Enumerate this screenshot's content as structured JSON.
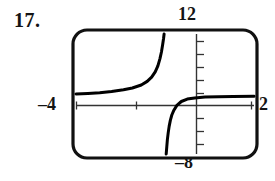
{
  "figure": {
    "exercise_number": "17.",
    "kind": "graphing-calculator-viewing-window",
    "labels": {
      "ymax": "12",
      "ymin": "–8",
      "xmin": "–4",
      "xmax": "2"
    },
    "colors": {
      "ink": "#141414",
      "curve": "#000000",
      "axis": "#333333",
      "frame": "#111111",
      "background": "#ffffff"
    }
  },
  "chart_data": {
    "type": "line",
    "title": "",
    "xlabel": "",
    "ylabel": "",
    "xlim": [
      -4,
      2
    ],
    "ylim": [
      -8,
      12
    ],
    "grid": false,
    "legend": false,
    "tick_labels": {
      "x": [
        "-4",
        "2"
      ],
      "y": [
        "-8",
        "12"
      ]
    },
    "x_tick_interval": 1,
    "y_tick_interval": 2,
    "asymptotes": {
      "vertical": [
        -1
      ],
      "horizontal": [
        1.5
      ]
    },
    "series": [
      {
        "name": "left-branch",
        "comment": "branch left of the vertical asymptote, rises from the horizontal asymptote to the top of the window",
        "x": [
          -4.0,
          -3.6,
          -3.2,
          -2.8,
          -2.4,
          -2.1,
          -1.8,
          -1.6,
          -1.45,
          -1.33,
          -1.24,
          -1.17,
          -1.12,
          -1.08,
          -1.05,
          -1.03
        ],
        "y": [
          2.0,
          2.1,
          2.2,
          2.4,
          2.7,
          3.0,
          3.5,
          4.1,
          4.8,
          5.7,
          6.7,
          7.9,
          9.0,
          10.2,
          11.2,
          12.0
        ]
      },
      {
        "name": "right-branch",
        "comment": "branch right of the vertical asymptote, rises from the bottom of the window and flattens toward the horizontal asymptote",
        "x": [
          -0.96,
          -0.94,
          -0.92,
          -0.89,
          -0.86,
          -0.82,
          -0.77,
          -0.7,
          -0.6,
          -0.45,
          -0.25,
          0.0,
          0.35,
          0.8,
          1.3,
          2.0
        ],
        "y": [
          -8.0,
          -6.8,
          -5.6,
          -4.4,
          -3.4,
          -2.4,
          -1.5,
          -0.7,
          0.1,
          0.75,
          1.15,
          1.35,
          1.48,
          1.56,
          1.6,
          1.62
        ]
      }
    ]
  }
}
